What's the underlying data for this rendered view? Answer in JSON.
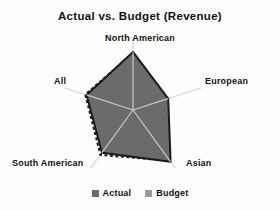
{
  "chart_data": {
    "type": "radar",
    "title": "Actual vs. Budget (Revenue)",
    "categories": [
      "North American",
      "European",
      "Asian",
      "South American",
      "All"
    ],
    "series": [
      {
        "name": "Actual",
        "values": [
          88,
          56,
          97,
          80,
          74
        ],
        "color": "#6b6b6b",
        "style": "solid-fill"
      },
      {
        "name": "Budget",
        "values": [
          86,
          54,
          95,
          84,
          76
        ],
        "color": "#1a1a1a",
        "style": "dashed-outline"
      }
    ],
    "rmax": 100,
    "grid": false,
    "legend_position": "bottom",
    "xlabel": "",
    "ylabel": ""
  },
  "title": "Actual vs. Budget (Revenue)",
  "axis_labels": {
    "north_american": "North American",
    "european": "European",
    "asian": "Asian",
    "south_american": "South American",
    "all": "All"
  },
  "legend": {
    "items": [
      {
        "label": "Actual",
        "color": "#6b6b6b"
      },
      {
        "label": "Budget",
        "color": "#9a9a9a"
      }
    ]
  },
  "colors": {
    "actual_fill": "#6b6b6b",
    "actual_stroke": "#1a1a1a",
    "budget_stroke": "#1a1a1a",
    "spoke": "#d8d8d8",
    "background": "#fdfdfd"
  }
}
